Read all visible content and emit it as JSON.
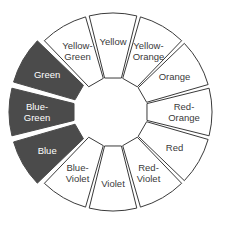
{
  "diagram": {
    "center": [
      113,
      112
    ],
    "outer_radius": 99,
    "inner_radius": 35,
    "gap_degrees": 2.2,
    "highlight_offset": 5,
    "colors": {
      "highlight_fill": "#4b4b4b",
      "highlight_text": "#ffffff",
      "normal_fill": "#ffffff",
      "normal_text": "#3a3a3a",
      "stroke": "#3a3a3a"
    },
    "segments": [
      {
        "name": "Yellow",
        "lines": [
          "Yellow"
        ],
        "highlighted": false
      },
      {
        "name": "Yellow-Orange",
        "lines": [
          "Yellow-",
          "Orange"
        ],
        "highlighted": false
      },
      {
        "name": "Orange",
        "lines": [
          "Orange"
        ],
        "highlighted": false
      },
      {
        "name": "Red-Orange",
        "lines": [
          "Red-",
          "Orange"
        ],
        "highlighted": false
      },
      {
        "name": "Red",
        "lines": [
          "Red"
        ],
        "highlighted": false
      },
      {
        "name": "Red-Violet",
        "lines": [
          "Red-",
          "Violet"
        ],
        "highlighted": false
      },
      {
        "name": "Violet",
        "lines": [
          "Violet"
        ],
        "highlighted": false
      },
      {
        "name": "Blue-Violet",
        "lines": [
          "Blue-",
          "Violet"
        ],
        "highlighted": false
      },
      {
        "name": "Blue",
        "lines": [
          "Blue"
        ],
        "highlighted": true
      },
      {
        "name": "Blue-Green",
        "lines": [
          "Blue-",
          "Green"
        ],
        "highlighted": true
      },
      {
        "name": "Green",
        "lines": [
          "Green"
        ],
        "highlighted": true
      },
      {
        "name": "Yellow-Green",
        "lines": [
          "Yellow-",
          "Green"
        ],
        "highlighted": false
      }
    ]
  }
}
